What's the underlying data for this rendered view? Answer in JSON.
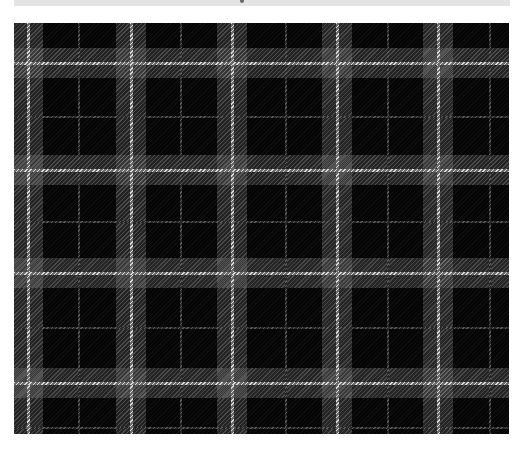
{
  "image": {
    "subject": "black and gray tartan plaid fabric swatch",
    "colors": {
      "background": "#050505",
      "band": "#3a3a3a",
      "bright_stripe": "#d8d8d8",
      "dim_stripe": "#5a5a5a",
      "page": "#ffffff",
      "top_bar": "#e4e4e4"
    },
    "fabric_bounds": {
      "x": 14,
      "y": 23,
      "width": 495,
      "height": 411
    },
    "bright_vertical_x": [
      28,
      131,
      232,
      337,
      438
    ],
    "dim_vertical_x": [
      79,
      181,
      286,
      388,
      490
    ],
    "bright_horizontal_y": [
      63,
      170,
      273,
      383
    ],
    "dim_horizontal_y": [
      117,
      222,
      328,
      428
    ],
    "band_width": 30
  }
}
